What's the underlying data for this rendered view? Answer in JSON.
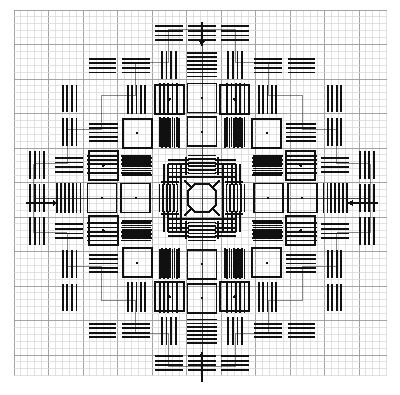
{
  "document": {
    "title": "Counted Thread Embroidery Pattern Chart",
    "type": "blackwork-diamond-medallion"
  },
  "canvas": {
    "width": 400,
    "height": 395,
    "background": "#ffffff"
  },
  "grid": {
    "origin_x": 14,
    "origin_y": 10,
    "cell": 6.9,
    "cols": 54,
    "rows": 53,
    "line_color": "#b9b9b9",
    "line_color_minor": "#d6d6d6",
    "major_every": 5,
    "major_color": "#9a9a9a",
    "visible": true
  },
  "stitch": {
    "color": "#101010",
    "bar_thickness": 1.7,
    "square_thickness": 1.9,
    "dot_radius": 1.3
  },
  "markers": {
    "arrow_color": "#101010",
    "items": [
      {
        "name": "top-center-arrow",
        "direction": "down",
        "x": 202,
        "y_from": 22,
        "y_to": 46
      },
      {
        "name": "bottom-center-arrow",
        "direction": "up",
        "x": 202,
        "y_from": 382,
        "y_to": 352
      },
      {
        "name": "left-center-arrow",
        "direction": "right",
        "y": 203,
        "x_from": 26,
        "x_to": 58
      },
      {
        "name": "right-center-arrow",
        "direction": "left",
        "y": 203,
        "x_from": 378,
        "x_to": 348
      }
    ]
  },
  "chart_data": {
    "type": "heatmap",
    "title": "Counted Thread Embroidery Pattern Chart",
    "xlabel": "",
    "ylabel": "",
    "grid": true,
    "legend": "",
    "categories": [],
    "values": [],
    "symmetry": "4-fold mirror (horizontal, vertical and both diagonals)",
    "center": {
      "x": 202,
      "y": 203
    },
    "motifs": [
      {
        "name": "center-octagon",
        "ring": 0,
        "x": 202,
        "y": 203
      },
      {
        "name": "inner-cross-block",
        "ring": 1,
        "count": 4
      },
      {
        "name": "square-with-dot",
        "ring": 2,
        "count": 8
      },
      {
        "name": "stitch-bar-bundle",
        "ring": 2,
        "count": 16
      },
      {
        "name": "square-with-dot",
        "ring": 3,
        "count": 8
      },
      {
        "name": "outer-tip-block",
        "ring": 4,
        "count": 4
      }
    ]
  }
}
